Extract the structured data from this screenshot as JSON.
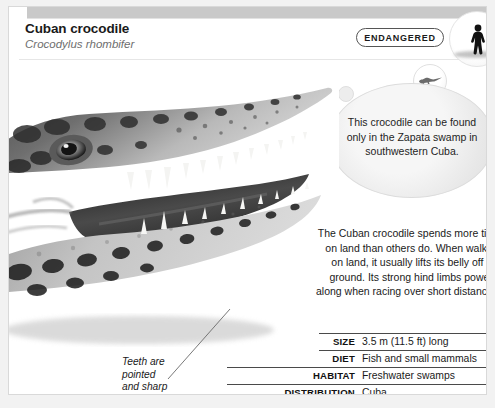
{
  "card": {
    "title": "Cuban crocodile",
    "scientific_name": "Crocodylus rhombifer"
  },
  "status": {
    "label": "ENDANGERED",
    "scale_icon": "human-silhouette-icon",
    "species_icon": "crocodile-silhouette-icon"
  },
  "callout": {
    "text": "This crocodile can be found only in the Zapata swamp in southwestern Cuba."
  },
  "description": {
    "text": "The Cuban crocodile spends more time on land than others do. When walking on land, it usually lifts its belly off the ground. Its strong hind limbs power it along when racing over short distances."
  },
  "photo": {
    "caption": "crocodile-head-photo"
  },
  "annotation": {
    "line1": "Teeth are",
    "line2": "pointed",
    "line3": "and sharp"
  },
  "facts": [
    {
      "label": "SIZE",
      "value": "3.5 m (11.5 ft) long",
      "indent": true
    },
    {
      "label": "DIET",
      "value": "Fish and small mammals",
      "indent": true
    },
    {
      "label": "HABITAT",
      "value": "Freshwater swamps",
      "indent": false
    },
    {
      "label": "DISTRIBUTION",
      "value": "Cuba",
      "indent": false
    }
  ],
  "colors": {
    "page_background": "#f2f2f2",
    "card_background": "#ffffff",
    "header_band": "#c9c9c9",
    "rule": "#4a4a4a",
    "text": "#1a1a1a",
    "muted_text": "#6e6e6e"
  }
}
